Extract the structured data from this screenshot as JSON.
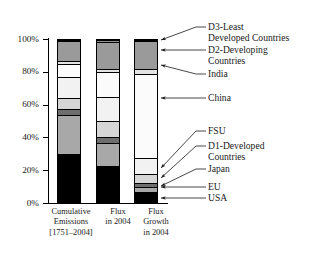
{
  "chart_data": {
    "type": "bar",
    "title": "",
    "subtitle": "",
    "xlabel": "",
    "ylabel": "",
    "ylim": [
      0,
      100
    ],
    "ytick_labels": [
      "0%",
      "20%",
      "40%",
      "60%",
      "80%",
      "100%"
    ],
    "ytick_values": [
      0,
      20,
      40,
      60,
      80,
      100
    ],
    "grid": false,
    "legend_position": "right-callouts",
    "stacked": true,
    "units": "percent",
    "categories": [
      "Cumulative Emissions [1751–2004]",
      "Flux in 2004",
      "Flux Growth in 2004"
    ],
    "series": [
      {
        "name": "USA",
        "fill": "#000000",
        "values": [
          29.5,
          22.0,
          6.0
        ]
      },
      {
        "name": "EU",
        "fill": "#a8a8a8",
        "values": [
          24.5,
          14.5,
          3.0
        ]
      },
      {
        "name": "Japan",
        "fill": "#6e6e6e",
        "values": [
          3.5,
          3.5,
          3.0
        ]
      },
      {
        "name": "D1-Developed Countries",
        "fill": "#d6d6d6",
        "values": [
          7.0,
          10.0,
          5.0
        ]
      },
      {
        "name": "FSU",
        "fill": "#f2f2f2",
        "values": [
          12.5,
          15.0,
          10.0
        ]
      },
      {
        "name": "China",
        "fill": "#fbfbfb",
        "values": [
          8.0,
          15.0,
          52.0
        ]
      },
      {
        "name": "India",
        "fill": "#e4e4e4",
        "values": [
          2.0,
          2.0,
          3.0
        ]
      },
      {
        "name": "D2-Developing Countries",
        "fill": "#9a9a9a",
        "values": [
          12.5,
          17.0,
          17.5
        ]
      },
      {
        "name": "D3-Least Developed Countries",
        "fill": "#8f8f8f",
        "values": [
          0.5,
          1.0,
          0.5
        ]
      }
    ],
    "annotations": [
      {
        "label": "D3-Least Developed Countries",
        "lines": [
          "D3-Least",
          "Developed Countries"
        ]
      },
      {
        "label": "D2-Developing Countries",
        "lines": [
          "D2-Developing",
          "Countries"
        ]
      },
      {
        "label": "India",
        "lines": [
          "India"
        ]
      },
      {
        "label": "China",
        "lines": [
          "China"
        ]
      },
      {
        "label": "FSU",
        "lines": [
          "FSU"
        ]
      },
      {
        "label": "D1-Developed Countries",
        "lines": [
          "D1-Developed",
          "Countries"
        ]
      },
      {
        "label": "Japan",
        "lines": [
          "Japan"
        ]
      },
      {
        "label": "EU",
        "lines": [
          "EU"
        ]
      },
      {
        "label": "USA",
        "lines": [
          "USA"
        ]
      }
    ]
  },
  "axis": {
    "tick_100": "100%",
    "tick_80": "80%",
    "tick_60": "60%",
    "tick_40": "40%",
    "tick_20": "20%",
    "tick_0": "0%"
  },
  "categories": {
    "cat1_line1": "Cumulative",
    "cat1_line2": "Emissions",
    "cat1_line3": "[1751–2004]",
    "cat2_line1": "Flux",
    "cat2_line2": "in 2004",
    "cat3_line1": "Flux",
    "cat3_line2": "Growth",
    "cat3_line3": "in 2004"
  },
  "callouts": {
    "d3_line1": "D3-Least",
    "d3_line2": "Developed Countries",
    "d2_line1": "D2-Developing",
    "d2_line2": "Countries",
    "india": "India",
    "china": "China",
    "fsu": "FSU",
    "d1_line1": "D1-Developed",
    "d1_line2": "Countries",
    "japan": "Japan",
    "eu": "EU",
    "usa": "USA"
  },
  "colors": {
    "axis": "#000000",
    "text": "#1a1a1a",
    "usa": "#000000",
    "eu": "#a8a8a8",
    "japan": "#6e6e6e",
    "d1": "#d6d6d6",
    "fsu": "#f2f2f2",
    "china": "#fbfbfb",
    "india": "#e4e4e4",
    "d2": "#9a9a9a",
    "d3": "#8f8f8f"
  }
}
